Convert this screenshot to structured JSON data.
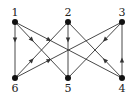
{
  "diagram": {
    "type": "directed-graph",
    "nodes": [
      {
        "id": "1",
        "label": "1",
        "x": 15,
        "y": 22,
        "label_pos": "above"
      },
      {
        "id": "2",
        "label": "2",
        "x": 68,
        "y": 22,
        "label_pos": "above"
      },
      {
        "id": "3",
        "label": "3",
        "x": 122,
        "y": 22,
        "label_pos": "above"
      },
      {
        "id": "6",
        "label": "6",
        "x": 15,
        "y": 78,
        "label_pos": "below"
      },
      {
        "id": "5",
        "label": "5",
        "x": 68,
        "y": 78,
        "label_pos": "below"
      },
      {
        "id": "4",
        "label": "4",
        "x": 122,
        "y": 78,
        "label_pos": "below"
      }
    ],
    "edges": [
      {
        "from": "1",
        "to": "6"
      },
      {
        "from": "1",
        "to": "5"
      },
      {
        "from": "1",
        "to": "4"
      },
      {
        "from": "2",
        "to": "5"
      },
      {
        "from": "6",
        "to": "2"
      },
      {
        "from": "4",
        "to": "2"
      },
      {
        "from": "6",
        "to": "3"
      },
      {
        "from": "3",
        "to": "5"
      },
      {
        "from": "4",
        "to": "3"
      }
    ],
    "colors": {
      "line": "#333333",
      "node": "#111111"
    }
  }
}
